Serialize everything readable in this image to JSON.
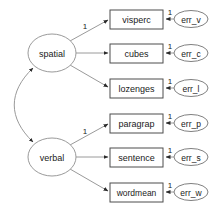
{
  "diagram": {
    "type": "sem-path-diagram",
    "width": 211,
    "height": 213,
    "background_color": "#ffffff",
    "line_color": "#9a9a9a",
    "box_stroke_color": "#4d4d4d",
    "text_color": "#1a1a1a"
  },
  "latents": [
    {
      "id": "spatial",
      "label": "spatial",
      "cx": 52,
      "cy": 53,
      "rx": 24,
      "ry": 19
    },
    {
      "id": "verbal",
      "label": "verbal",
      "cx": 52,
      "cy": 157,
      "rx": 24,
      "ry": 19
    }
  ],
  "indicators": [
    {
      "id": "visperc",
      "label": "visperc",
      "x": 110,
      "y": 10,
      "w": 53,
      "h": 19,
      "latent": "spatial",
      "loading_label": "1",
      "show_loading": true
    },
    {
      "id": "cubes",
      "label": "cubes",
      "x": 110,
      "y": 44,
      "w": 53,
      "h": 19,
      "latent": "spatial",
      "loading_label": "",
      "show_loading": false
    },
    {
      "id": "lozenges",
      "label": "lozenges",
      "x": 110,
      "y": 79,
      "w": 53,
      "h": 19,
      "latent": "spatial",
      "loading_label": "",
      "show_loading": false
    },
    {
      "id": "paragrap",
      "label": "paragrap",
      "x": 110,
      "y": 114,
      "w": 53,
      "h": 19,
      "latent": "verbal",
      "loading_label": "1",
      "show_loading": true
    },
    {
      "id": "sentence",
      "label": "sentence",
      "x": 110,
      "y": 148,
      "w": 53,
      "h": 19,
      "latent": "verbal",
      "loading_label": "",
      "show_loading": false
    },
    {
      "id": "wordmean",
      "label": "wordmean",
      "x": 110,
      "y": 183,
      "w": 53,
      "h": 19,
      "latent": "verbal",
      "loading_label": "",
      "show_loading": false
    }
  ],
  "errors": [
    {
      "id": "err_v",
      "label": "err_v",
      "cx": 191,
      "cy": 19,
      "rx": 17,
      "ry": 8,
      "target": "visperc",
      "path_label": "1"
    },
    {
      "id": "err_c",
      "label": "err_c",
      "cx": 191,
      "cy": 53,
      "rx": 17,
      "ry": 8,
      "target": "cubes",
      "path_label": "1"
    },
    {
      "id": "err_l",
      "label": "err_l",
      "cx": 191,
      "cy": 88,
      "rx": 17,
      "ry": 8,
      "target": "lozenges",
      "path_label": "1"
    },
    {
      "id": "err_p",
      "label": "err_p",
      "cx": 191,
      "cy": 123,
      "rx": 17,
      "ry": 8,
      "target": "paragrap",
      "path_label": "1"
    },
    {
      "id": "err_s",
      "label": "err_s",
      "cx": 191,
      "cy": 157,
      "rx": 17,
      "ry": 8,
      "target": "sentence",
      "path_label": "1"
    },
    {
      "id": "err_w",
      "label": "err_w",
      "cx": 191,
      "cy": 192,
      "rx": 17,
      "ry": 8,
      "target": "wordmean",
      "path_label": "1"
    }
  ],
  "covariance": {
    "from": "spatial",
    "to": "verbal",
    "label": "",
    "double_headed": true
  },
  "loading_label_positions": [
    {
      "for": "visperc",
      "label": "1",
      "x": 85,
      "y": 26
    },
    {
      "for": "paragrap",
      "label": "1",
      "x": 85,
      "y": 131
    }
  ],
  "error_label_positions": [
    {
      "for": "err_v",
      "label": "1",
      "x": 170,
      "y": 12
    },
    {
      "for": "err_c",
      "label": "1",
      "x": 170,
      "y": 46
    },
    {
      "for": "err_l",
      "label": "1",
      "x": 170,
      "y": 81
    },
    {
      "for": "err_p",
      "label": "1",
      "x": 170,
      "y": 116
    },
    {
      "for": "err_s",
      "label": "1",
      "x": 170,
      "y": 150
    },
    {
      "for": "err_w",
      "label": "1",
      "x": 170,
      "y": 185
    }
  ]
}
